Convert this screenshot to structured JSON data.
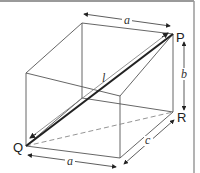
{
  "diagram": {
    "type": "cuboid-space-diagonal",
    "vertices": {
      "back_top_left": [
        82,
        23
      ],
      "P": [
        173,
        34
      ],
      "front_top_left": [
        26,
        73
      ],
      "front_top_right": [
        120,
        96
      ],
      "back_bottom_left": [
        82,
        98
      ],
      "R": [
        173,
        112
      ],
      "Q": [
        26,
        146
      ],
      "front_bottom_right": [
        120,
        158
      ]
    },
    "labels": {
      "P": "P",
      "Q": "Q",
      "R": "R",
      "diagonal": "l",
      "width_top": "a",
      "width_bottom": "a",
      "height": "b",
      "depth": "c"
    },
    "colors": {
      "edge": "#555555",
      "diagonal": "#222222",
      "dashed": "#888888",
      "border": "#9a9a9a"
    }
  }
}
